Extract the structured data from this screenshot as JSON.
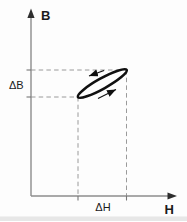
{
  "labels": {
    "y_axis": "B",
    "x_axis": "H",
    "delta_b": "ΔB",
    "delta_h": "ΔH"
  },
  "colors": {
    "background": "#fdfdfd",
    "axis": "#8c8c8c",
    "axis_arrow": "#2e2e2e",
    "dash": "#9a9a9a",
    "tick": "#777777",
    "loop": "#101010",
    "label": "#1b1b1b",
    "scan_edge": "#d6d6d6"
  },
  "geometry": {
    "axes": {
      "origin": {
        "x": 31,
        "y": 196
      },
      "y_top": 17,
      "x_right": 169,
      "y_arrow_points": [
        [
          31,
          8.5
        ],
        [
          27.4,
          18
        ],
        [
          34.6,
          18
        ]
      ],
      "x_arrow_points": [
        [
          177,
          196
        ],
        [
          167.5,
          192.4
        ],
        [
          167.5,
          199.6
        ]
      ]
    },
    "ticks": [
      {
        "x1": 26.5,
        "y1": 70,
        "x2": 31,
        "y2": 70
      },
      {
        "x1": 26.5,
        "y1": 97,
        "x2": 31,
        "y2": 97
      },
      {
        "x1": 78,
        "y1": 196,
        "x2": 78,
        "y2": 200.5
      },
      {
        "x1": 126.5,
        "y1": 196,
        "x2": 126.5,
        "y2": 200.5
      }
    ],
    "guides": [
      {
        "x1": 31,
        "y1": 70,
        "x2": 126.5,
        "y2": 70
      },
      {
        "x1": 31,
        "y1": 97,
        "x2": 78,
        "y2": 97
      },
      {
        "x1": 78,
        "y1": 97,
        "x2": 78,
        "y2": 196
      },
      {
        "x1": 126.5,
        "y1": 70,
        "x2": 126.5,
        "y2": 196
      }
    ],
    "dash_array": "4.5 3.2",
    "loop": {
      "cx": 102.3,
      "cy": 83.5,
      "rx": 27.9,
      "ry": 5.2,
      "angle": -29.1,
      "stroke_width": 2.6,
      "end_low": {
        "x": 78,
        "y": 97
      },
      "end_high": {
        "x": 126.5,
        "y": 70
      }
    },
    "direction_arrows": [
      {
        "x1": 104,
        "y1": 70.5,
        "x2": 89,
        "y2": 76,
        "position": "upper"
      },
      {
        "x1": 98,
        "y1": 98.5,
        "x2": 116,
        "y2": 89.5,
        "position": "lower"
      }
    ],
    "scan_edge": {
      "x": 0,
      "y": 216.5,
      "width": 187,
      "height": 4.5,
      "opacity": 0.55
    }
  }
}
